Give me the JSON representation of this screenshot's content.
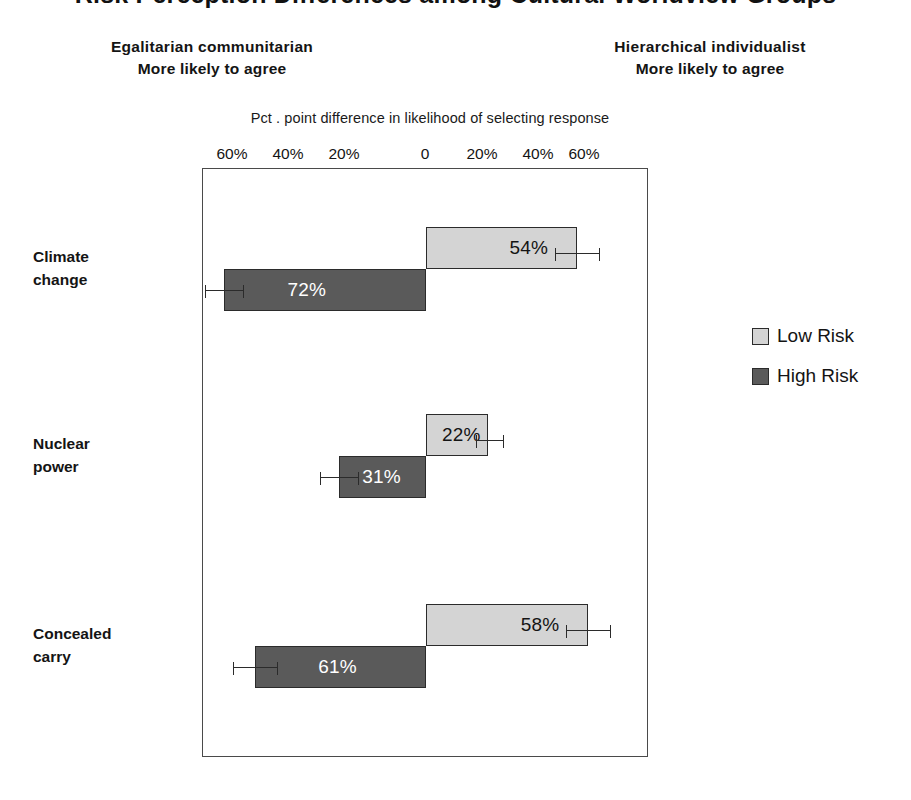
{
  "title": "Risk Perception Differences among Cultural Worldview Groups",
  "header": {
    "left": {
      "line1": "Egalitarian communitarian",
      "line2": "More likely to agree"
    },
    "right": {
      "line1": "Hierarchical individualist",
      "line2": "More likely to agree"
    }
  },
  "axis_caption": "Pct . point difference in likelihood of selecting  response",
  "legend": {
    "items": [
      {
        "label": "Low Risk",
        "color": "#d4d4d4"
      },
      {
        "label": "High Risk",
        "color": "#5a5a5a"
      }
    ]
  },
  "chart_data": {
    "type": "bar",
    "orientation": "horizontal",
    "style": "diverging",
    "title": "Risk Perception Differences among Cultural Worldview Groups",
    "xlabel": "Pct . point difference in likelihood of selecting  response",
    "ylabel": "",
    "xlim": [
      -70,
      70
    ],
    "grid": false,
    "legend_position": "right",
    "left_side_label": "Egalitarian communitarian More likely to agree",
    "right_side_label": "Hierarchical individualist More likely to agree",
    "tick_labels": [
      "60%",
      "40%",
      "20%",
      "0",
      "20%",
      "40%",
      "60%"
    ],
    "tick_values": [
      -60,
      -40,
      -20,
      0,
      20,
      40,
      60
    ],
    "categories": [
      "Climate change",
      "Nuclear power",
      "Concealed carry"
    ],
    "series": [
      {
        "name": "Low Risk",
        "color": "#d4d4d4",
        "direction": "right",
        "values": [
          54,
          22,
          58
        ],
        "labels": [
          "54%",
          "22%",
          "58%"
        ],
        "error_low": [
          46,
          18,
          50
        ],
        "error_high": [
          62,
          28,
          66
        ]
      },
      {
        "name": "High Risk",
        "color": "#5a5a5a",
        "direction": "left",
        "values": [
          72,
          31,
          61
        ],
        "labels": [
          "72%",
          "31%",
          "61%"
        ],
        "error_low": [
          65,
          24,
          53
        ],
        "error_high": [
          79,
          38,
          69
        ]
      }
    ]
  },
  "rows": [
    {
      "category_line1": "Climate",
      "category_line2": "change",
      "low": {
        "value": 54,
        "label": "54%"
      },
      "high": {
        "value": 72,
        "label": "72%"
      }
    },
    {
      "category_line1": "Nuclear",
      "category_line2": "power",
      "low": {
        "value": 22,
        "label": "22%"
      },
      "high": {
        "value": 31,
        "label": "31%"
      }
    },
    {
      "category_line1": "Concealed",
      "category_line2": "carry",
      "low": {
        "value": 58,
        "label": "58%"
      },
      "high": {
        "value": 61,
        "label": "61%"
      }
    }
  ],
  "ticks": [
    {
      "label": "60%",
      "x": 232
    },
    {
      "label": "40%",
      "x": 288
    },
    {
      "label": "20%",
      "x": 344
    },
    {
      "label": "0",
      "x": 425
    },
    {
      "label": "20%",
      "x": 482
    },
    {
      "label": "40%",
      "x": 538
    },
    {
      "label": "60%",
      "x": 584
    }
  ]
}
